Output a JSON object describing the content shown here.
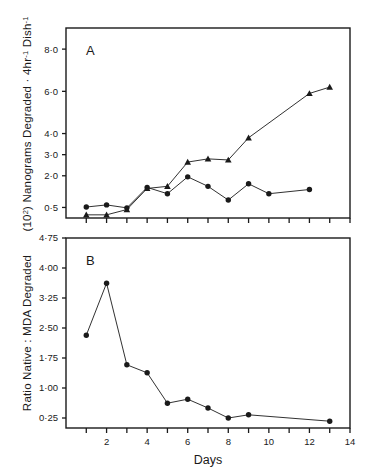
{
  "figure": {
    "background": "#ffffff",
    "ink": "#1a1a1a",
    "xlabel": "Days"
  },
  "chart_data": [
    {
      "type": "line",
      "panel_label": "A",
      "title": "",
      "xlabel": "",
      "ylabel": "(10²) Nanograms Degraded · 4hr⁻¹ Dish⁻¹",
      "ylabel_parts": {
        "prefix": "(10",
        "sup1": "2",
        "mid": ") Nanograms Degraded · 4hr",
        "sup2": "-1",
        "mid2": " Dish",
        "sup3": "-1"
      },
      "xlim": [
        0,
        14
      ],
      "ylim": [
        0,
        9.0
      ],
      "grid": false,
      "legend": "none",
      "xticks": [
        1,
        2,
        3,
        4,
        5,
        6,
        7,
        8,
        9,
        10,
        11,
        12,
        13,
        14
      ],
      "xticklabels": [
        "",
        "",
        "",
        "",
        "",
        "",
        "",
        "",
        "",
        "",
        "",
        "",
        "",
        ""
      ],
      "yticks": [
        0.5,
        2.0,
        3.0,
        4.0,
        6.0,
        8.0
      ],
      "yticklabels": [
        "0·5",
        "2·0",
        "3·0",
        "4·0",
        "6·0",
        "8·0"
      ],
      "x": [
        1,
        2,
        3,
        4,
        5,
        6,
        7,
        8,
        9,
        10,
        12,
        13
      ],
      "series": [
        {
          "name": "native",
          "marker": "circle",
          "values": [
            0.52,
            0.62,
            0.48,
            1.45,
            1.15,
            1.95,
            1.5,
            0.85,
            1.62,
            1.15,
            1.35,
            null
          ]
        },
        {
          "name": "MDA-modified",
          "marker": "triangle",
          "values": [
            0.15,
            0.15,
            0.4,
            1.4,
            1.5,
            2.65,
            2.8,
            2.75,
            3.8,
            null,
            5.9,
            6.2
          ]
        }
      ]
    },
    {
      "type": "line",
      "panel_label": "B",
      "title": "",
      "xlabel": "Days",
      "ylabel": "Ratio Native : MDA Degraded",
      "xlim": [
        0,
        14
      ],
      "ylim": [
        0,
        4.75
      ],
      "grid": false,
      "legend": "none",
      "xticks": [
        1,
        2,
        3,
        4,
        5,
        6,
        7,
        8,
        9,
        10,
        11,
        12,
        13,
        14
      ],
      "xticklabels": [
        "",
        "2",
        "",
        "4",
        "",
        "6",
        "",
        "8",
        "",
        "10",
        "",
        "12",
        "",
        "14"
      ],
      "yticks": [
        0.25,
        1.0,
        1.75,
        2.5,
        3.25,
        4.0,
        4.75
      ],
      "yticklabels": [
        "0·25",
        "1·00",
        "1·75",
        "2·50",
        "3·25",
        "4·00",
        "4·75"
      ],
      "x": [
        1,
        2,
        3,
        4,
        5,
        6,
        7,
        8,
        9,
        13
      ],
      "series": [
        {
          "name": "ratio",
          "marker": "circle",
          "values": [
            2.32,
            3.62,
            1.58,
            1.38,
            0.62,
            0.72,
            0.5,
            0.25,
            0.33,
            0.17
          ]
        }
      ]
    }
  ]
}
